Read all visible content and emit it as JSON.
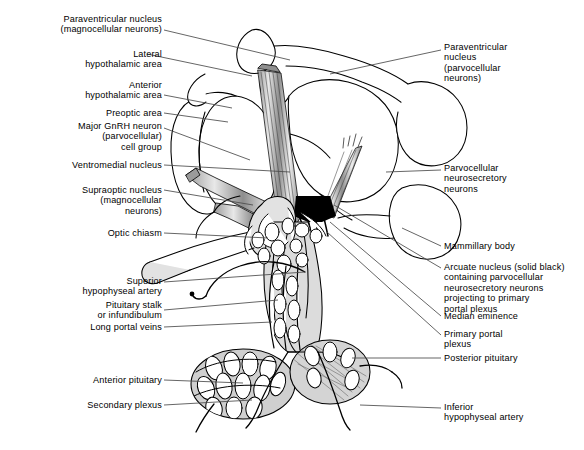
{
  "figure": {
    "type": "anatomical-diagram",
    "style": "black-and-white line drawing with gray shading"
  },
  "labels_left": [
    {
      "id": "paraventricular-nucleus-magnocellular",
      "lines": [
        "Paraventricular nucleus",
        "(magnocellular neurons)"
      ],
      "x": 12,
      "y": 14,
      "width": 150,
      "align": "right",
      "leader": [
        [
          164,
          30
        ],
        [
          290,
          60
        ]
      ]
    },
    {
      "id": "lateral-hypothalamic-area",
      "lines": [
        "Lateral",
        "hypothalamic area"
      ],
      "x": 12,
      "y": 49,
      "width": 150,
      "align": "right",
      "leader": [
        [
          147,
          54
        ],
        [
          252,
          76
        ]
      ]
    },
    {
      "id": "anterior-hypothalamic-area",
      "lines": [
        "Anterior",
        "hypothalamic area"
      ],
      "x": 12,
      "y": 80,
      "width": 150,
      "align": "right",
      "leader": [
        [
          164,
          95
        ],
        [
          232,
          108
        ]
      ]
    },
    {
      "id": "preoptic-area",
      "lines": [
        "Preoptic area"
      ],
      "x": 12,
      "y": 108,
      "width": 150,
      "align": "right",
      "leader": [
        [
          164,
          113
        ],
        [
          228,
          122
        ]
      ]
    },
    {
      "id": "major-gnrh-neuron-cell-group",
      "lines": [
        "Major GnRH neuron",
        "(parvocellular)",
        "cell group"
      ],
      "x": 12,
      "y": 121,
      "width": 150,
      "align": "right",
      "leader": [
        [
          164,
          128
        ],
        [
          250,
          160
        ]
      ]
    },
    {
      "id": "ventromedial-nucleus",
      "lines": [
        "Ventromedial nucleus"
      ],
      "x": 12,
      "y": 160,
      "width": 150,
      "align": "right",
      "leader": [
        [
          164,
          165
        ],
        [
          290,
          172
        ]
      ]
    },
    {
      "id": "supraoptic-nucleus-magnocellular",
      "lines": [
        "Supraoptic nucleus",
        "(magnocellular",
        "neurons)"
      ],
      "x": 12,
      "y": 185,
      "width": 150,
      "align": "right",
      "leader": [
        [
          164,
          190
        ],
        [
          253,
          205
        ]
      ]
    },
    {
      "id": "optic-chiasm",
      "lines": [
        "Optic chiasm"
      ],
      "x": 12,
      "y": 228,
      "width": 150,
      "align": "right",
      "leader": [
        [
          164,
          233
        ],
        [
          268,
          238
        ]
      ]
    },
    {
      "id": "superior-hypophyseal-artery",
      "lines": [
        "Superior",
        "hypophyseal artery"
      ],
      "x": 12,
      "y": 276,
      "width": 150,
      "align": "right",
      "leader": [
        [
          164,
          282
        ],
        [
          305,
          272
        ]
      ]
    },
    {
      "id": "pituitary-stalk-infundibulum",
      "lines": [
        "Pituitary stalk",
        "or infundibulum"
      ],
      "x": 12,
      "y": 300,
      "width": 150,
      "align": "right",
      "leader": [
        [
          164,
          310
        ],
        [
          278,
          300
        ]
      ]
    },
    {
      "id": "long-portal-veins",
      "lines": [
        "Long portal veins"
      ],
      "x": 12,
      "y": 322,
      "width": 150,
      "align": "right",
      "leader": [
        [
          164,
          327
        ],
        [
          272,
          322
        ]
      ]
    },
    {
      "id": "anterior-pituitary",
      "lines": [
        "Anterior pituitary"
      ],
      "x": 12,
      "y": 375,
      "width": 150,
      "align": "right",
      "leader": [
        [
          164,
          380
        ],
        [
          243,
          383
        ]
      ]
    },
    {
      "id": "secondary-plexus",
      "lines": [
        "Secondary plexus"
      ],
      "x": 12,
      "y": 400,
      "width": 150,
      "align": "right",
      "leader": [
        [
          164,
          405
        ],
        [
          252,
          400
        ]
      ]
    }
  ],
  "labels_right": [
    {
      "id": "paraventricular-nucleus-parvocellular",
      "lines": [
        "Paraventricular",
        "nucleus",
        "(parvocellular",
        "neurons)"
      ],
      "x": 444,
      "y": 42,
      "width": 136,
      "align": "left",
      "leader": [
        [
          441,
          50
        ],
        [
          330,
          74
        ]
      ]
    },
    {
      "id": "parvocellular-neurosecretory-neurons",
      "lines": [
        "Parvocellular",
        "neurosecretory",
        "neurons"
      ],
      "x": 444,
      "y": 163,
      "width": 136,
      "align": "left",
      "leader": [
        [
          441,
          170
        ],
        [
          386,
          172
        ]
      ]
    },
    {
      "id": "mammillary-body",
      "lines": [
        "Mammillary body"
      ],
      "x": 444,
      "y": 241,
      "width": 136,
      "align": "left",
      "leader": [
        [
          441,
          246
        ],
        [
          402,
          228
        ]
      ]
    },
    {
      "id": "arcuate-nucleus",
      "lines": [
        "Arcuate nucleus (solid black)",
        "containing parvocellular",
        "neurosecretory neurons",
        "projecting to primary",
        "portal plexus"
      ],
      "x": 444,
      "y": 262,
      "width": 140,
      "align": "left",
      "leader": [
        [
          441,
          268
        ],
        [
          334,
          205
        ]
      ]
    },
    {
      "id": "median-eminence",
      "lines": [
        "Median eminence"
      ],
      "x": 444,
      "y": 311,
      "width": 136,
      "align": "left",
      "leader": [
        [
          441,
          316
        ],
        [
          330,
          222
        ]
      ]
    },
    {
      "id": "primary-portal-plexus",
      "lines": [
        "Primary portal",
        "plexus"
      ],
      "x": 444,
      "y": 329,
      "width": 136,
      "align": "left",
      "leader": [
        [
          441,
          335
        ],
        [
          327,
          232
        ]
      ]
    },
    {
      "id": "posterior-pituitary",
      "lines": [
        "Posterior pituitary"
      ],
      "x": 444,
      "y": 353,
      "width": 136,
      "align": "left",
      "leader": [
        [
          441,
          358
        ],
        [
          352,
          358
        ]
      ]
    },
    {
      "id": "inferior-hypophyseal-artery",
      "lines": [
        "Inferior",
        "hypophyseal artery"
      ],
      "x": 444,
      "y": 402,
      "width": 136,
      "align": "left",
      "leader": [
        [
          441,
          408
        ],
        [
          360,
          405
        ]
      ]
    }
  ],
  "colors": {
    "ink": "#000000",
    "leader": "#4a4a4a",
    "shade_light": "#e4e4e4",
    "shade_mid": "#c9c9c9",
    "shade_dark": "#a8a8a8",
    "solid_black": "#000000",
    "background": "#ffffff"
  }
}
